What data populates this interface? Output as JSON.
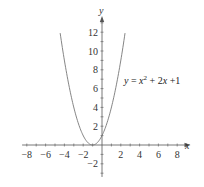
{
  "chart_data": {
    "type": "line",
    "title": "",
    "xlabel": "x",
    "ylabel": "y",
    "xlim": [
      -8.5,
      9.2
    ],
    "ylim": [
      -3.4,
      13.4
    ],
    "grid": false,
    "x_ticks": [
      -8,
      -6,
      -4,
      -2,
      2,
      4,
      6,
      8
    ],
    "y_ticks": [
      -2,
      2,
      4,
      6,
      8,
      10,
      12
    ],
    "x_minor_step": 1,
    "y_minor_step": 1,
    "series": [
      {
        "name": "y = x^2 + 2x + 1",
        "expression": "x^2 + 2x + 1",
        "x_range": [
          -4.45,
          2.45
        ],
        "x": [
          -4.45,
          -4,
          -3.5,
          -3,
          -2.5,
          -2,
          -1.5,
          -1,
          -0.5,
          0,
          0.5,
          1,
          1.5,
          2,
          2.45
        ],
        "values": [
          11.9,
          9,
          6.25,
          4,
          2.25,
          1,
          0.25,
          0,
          0.25,
          1,
          2.25,
          4,
          6.25,
          9,
          11.9
        ],
        "color": "#777777"
      }
    ],
    "annotations": [
      {
        "text_base": "y = x",
        "superscript": "2",
        "text_rest": " + 2x +1",
        "x": 1.6,
        "y": 7.2
      }
    ]
  },
  "labels": {
    "x_axis": "x",
    "y_axis": "y",
    "x_ticks": [
      "−8",
      "−6",
      "−4",
      "−2",
      "2",
      "4",
      "6",
      "8"
    ],
    "y_ticks": [
      "12",
      "10",
      "8",
      "6",
      "4",
      "2",
      "−2"
    ],
    "equation": {
      "y": "y",
      "eq": " = ",
      "x": "x",
      "sup": "2",
      "rest1": " + 2",
      "x2": "x",
      "rest2": " +1"
    }
  }
}
